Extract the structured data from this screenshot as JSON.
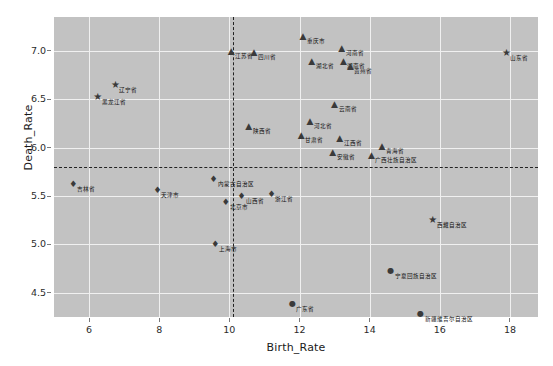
{
  "chart_data": {
    "type": "scatter",
    "title": "",
    "xlabel": "Birth_Rate",
    "ylabel": "Death_Rate",
    "xlim": [
      5.0,
      18.8
    ],
    "ylim": [
      4.25,
      7.35
    ],
    "xticks": [
      6,
      8,
      10,
      12,
      14,
      16,
      18
    ],
    "yticks": [
      4.5,
      5.0,
      5.5,
      6.0,
      6.5,
      7.0
    ],
    "grid": true,
    "legend": "none",
    "panel_color": "#c2c2c2",
    "grid_color": "#f0f0f0",
    "point_color": "#3a3a3a",
    "reference_lines": [
      {
        "orientation": "horizontal",
        "value": 5.8,
        "style": "dashed",
        "color": "#222222"
      },
      {
        "orientation": "vertical",
        "value": 10.1,
        "style": "dashed",
        "color": "#222222"
      }
    ],
    "points": [
      {
        "label": "辽宁省",
        "x": 6.75,
        "y": 6.65,
        "marker": "star"
      },
      {
        "label": "黑龙江省",
        "x": 6.25,
        "y": 6.52,
        "marker": "star"
      },
      {
        "label": "山东省",
        "x": 17.9,
        "y": 6.98,
        "marker": "star"
      },
      {
        "label": "西藏自治区",
        "x": 15.8,
        "y": 5.25,
        "marker": "star"
      },
      {
        "label": "江苏省",
        "x": 10.05,
        "y": 7.0,
        "marker": "triangle"
      },
      {
        "label": "四川省",
        "x": 10.7,
        "y": 6.99,
        "marker": "triangle"
      },
      {
        "label": "重庆市",
        "x": 12.1,
        "y": 7.15,
        "marker": "triangle"
      },
      {
        "label": "河南省",
        "x": 13.2,
        "y": 7.03,
        "marker": "triangle"
      },
      {
        "label": "湖北省",
        "x": 12.35,
        "y": 6.9,
        "marker": "triangle"
      },
      {
        "label": "湖南省",
        "x": 13.25,
        "y": 6.9,
        "marker": "triangle"
      },
      {
        "label": "贵州省",
        "x": 13.45,
        "y": 6.84,
        "marker": "triangle"
      },
      {
        "label": "云南省",
        "x": 13.0,
        "y": 6.45,
        "marker": "triangle"
      },
      {
        "label": "陕西省",
        "x": 10.55,
        "y": 6.22,
        "marker": "triangle"
      },
      {
        "label": "河北省",
        "x": 12.3,
        "y": 6.28,
        "marker": "triangle"
      },
      {
        "label": "甘肃省",
        "x": 12.05,
        "y": 6.13,
        "marker": "triangle"
      },
      {
        "label": "江西省",
        "x": 13.15,
        "y": 6.1,
        "marker": "triangle"
      },
      {
        "label": "广西壮族自治区",
        "x": 14.05,
        "y": 5.92,
        "marker": "triangle"
      },
      {
        "label": "青海省",
        "x": 14.35,
        "y": 6.02,
        "marker": "triangle"
      },
      {
        "label": "安徽省",
        "x": 12.95,
        "y": 5.96,
        "marker": "triangle"
      },
      {
        "label": "吉林省",
        "x": 5.55,
        "y": 5.62,
        "marker": "diamond"
      },
      {
        "label": "天津市",
        "x": 7.95,
        "y": 5.56,
        "marker": "diamond"
      },
      {
        "label": "内蒙古自治区",
        "x": 9.55,
        "y": 5.68,
        "marker": "diamond"
      },
      {
        "label": "山西省",
        "x": 10.35,
        "y": 5.5,
        "marker": "diamond"
      },
      {
        "label": "浙江省",
        "x": 11.2,
        "y": 5.52,
        "marker": "diamond"
      },
      {
        "label": "北京市",
        "x": 9.9,
        "y": 5.44,
        "marker": "diamond"
      },
      {
        "label": "上海市",
        "x": 9.6,
        "y": 5.0,
        "marker": "diamond"
      },
      {
        "label": "宁夏回族自治区",
        "x": 14.6,
        "y": 4.73,
        "marker": "circle"
      },
      {
        "label": "广东省",
        "x": 11.8,
        "y": 4.38,
        "marker": "circle"
      },
      {
        "label": "新疆维吾尔自治区",
        "x": 15.45,
        "y": 4.28,
        "marker": "circle"
      }
    ]
  }
}
